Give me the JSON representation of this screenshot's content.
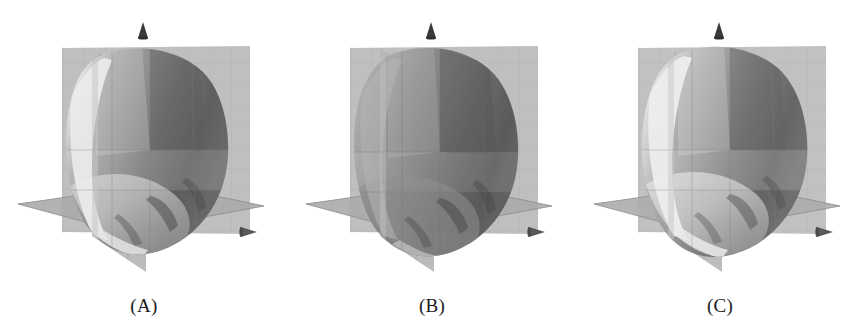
{
  "figure": {
    "background_color": "#ffffff",
    "panel_count": 3,
    "width": 865,
    "height": 336
  },
  "palette": {
    "background": "#ffffff",
    "plane_light": "#b9b9b9",
    "plane_mid": "#ababab",
    "plane_dark": "#9d9d9d",
    "grid_line": "#8f8f8f",
    "surface_dark": "#585858",
    "surface_mid_dark": "#6e6e6e",
    "surface_mid": "#8a8a8a",
    "surface_light": "#c3c3c3",
    "surface_highlight": "#ebebeb",
    "arrow_cone": "#3a3a3a",
    "label_text": "#1a1a1a",
    "edge_line": "#6a6a6a"
  },
  "panels": [
    {
      "id": "panel-a",
      "label": "(A)",
      "icons": {
        "z_axis_arrow": "up-cone-icon",
        "x_axis_arrow": "right-cone-icon"
      },
      "shading": {
        "left_highlight": "#ebebeb",
        "body_mid": "#9a9a9a",
        "body_dark": "#585858",
        "bottom_light": "#d2d2d2",
        "highlight_strength": "strong"
      }
    },
    {
      "id": "panel-b",
      "label": "(B)",
      "icons": {
        "z_axis_arrow": "up-cone-icon",
        "x_axis_arrow": "right-cone-icon"
      },
      "shading": {
        "left_highlight": "#b4b4b4",
        "body_mid": "#8a8a8a",
        "body_dark": "#535353",
        "bottom_light": "#a8a8a8",
        "highlight_strength": "weak"
      }
    },
    {
      "id": "panel-c",
      "label": "(C)",
      "icons": {
        "z_axis_arrow": "up-cone-icon",
        "x_axis_arrow": "right-cone-icon"
      },
      "shading": {
        "left_highlight": "#ececec",
        "body_mid": "#a6a6a6",
        "body_dark": "#5f5f5f",
        "bottom_light": "#dcdcdc",
        "highlight_strength": "strong"
      }
    }
  ],
  "scene_description": {
    "planes": [
      "back-vertical-plane-xz",
      "side-vertical-plane-yz",
      "horizontal-plane-xy"
    ],
    "surface": "grey-translucent-isosurface-blob",
    "axes_shown": [
      "z-up-arrow",
      "x-right-arrow"
    ],
    "grid": "on"
  }
}
